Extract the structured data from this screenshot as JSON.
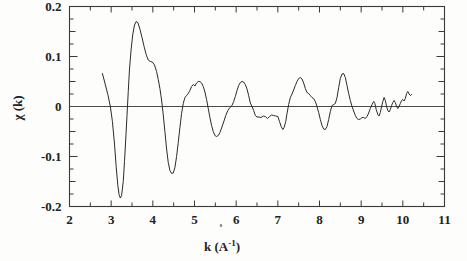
{
  "figure": {
    "title": "",
    "background_color": "#fdfdfc",
    "line_color": "#2b2b2b",
    "axis_color": "#3a3a3a"
  },
  "axes": {
    "x_title_prefix": "k (",
    "x_title_element": "A",
    "x_title_ring": "˚",
    "x_title_exponent": "-1",
    "x_title_suffix": ")",
    "x_title_full": "k (Å⁻¹)",
    "y_title": "χ (k)",
    "x_tick_labels": [
      "2",
      "3",
      "4",
      "5",
      "6",
      "7",
      "8",
      "9",
      "10",
      "11"
    ],
    "y_tick_labels": [
      "0.2",
      "0.1",
      "0",
      "-0.1",
      "-0.2"
    ],
    "x_minor_step": 0.5,
    "y_minor_step": 0.025,
    "grid": "off"
  },
  "chart_data": {
    "type": "line",
    "title": "",
    "xlabel": "k (Å⁻¹)",
    "ylabel": "χ (k)",
    "xlim": [
      2,
      11
    ],
    "ylim": [
      -0.2,
      0.2
    ],
    "xticks": [
      2,
      3,
      4,
      5,
      6,
      7,
      8,
      9,
      10,
      11
    ],
    "yticks": [
      -0.2,
      -0.1,
      0,
      0.1,
      0.2
    ],
    "grid": false,
    "legend": "none",
    "series": [
      {
        "name": "chi(k)",
        "color": "#2b2b2b",
        "points": [
          [
            2.79,
            0.066
          ],
          [
            2.85,
            0.047
          ],
          [
            2.92,
            0.024
          ],
          [
            2.98,
            0.0
          ],
          [
            3.03,
            -0.03
          ],
          [
            3.08,
            -0.075
          ],
          [
            3.12,
            -0.12
          ],
          [
            3.16,
            -0.158
          ],
          [
            3.19,
            -0.176
          ],
          [
            3.22,
            -0.183
          ],
          [
            3.25,
            -0.178
          ],
          [
            3.29,
            -0.15
          ],
          [
            3.32,
            -0.11
          ],
          [
            3.35,
            -0.065
          ],
          [
            3.38,
            -0.018
          ],
          [
            3.41,
            0.03
          ],
          [
            3.44,
            0.075
          ],
          [
            3.48,
            0.115
          ],
          [
            3.52,
            0.145
          ],
          [
            3.56,
            0.163
          ],
          [
            3.6,
            0.17
          ],
          [
            3.64,
            0.168
          ],
          [
            3.69,
            0.155
          ],
          [
            3.74,
            0.138
          ],
          [
            3.79,
            0.12
          ],
          [
            3.84,
            0.104
          ],
          [
            3.89,
            0.093
          ],
          [
            3.94,
            0.09
          ],
          [
            3.99,
            0.089
          ],
          [
            4.04,
            0.083
          ],
          [
            4.09,
            0.07
          ],
          [
            4.13,
            0.054
          ],
          [
            4.17,
            0.036
          ],
          [
            4.21,
            0.013
          ],
          [
            4.25,
            -0.017
          ],
          [
            4.29,
            -0.05
          ],
          [
            4.33,
            -0.085
          ],
          [
            4.37,
            -0.112
          ],
          [
            4.41,
            -0.128
          ],
          [
            4.45,
            -0.134
          ],
          [
            4.49,
            -0.133
          ],
          [
            4.53,
            -0.122
          ],
          [
            4.57,
            -0.1
          ],
          [
            4.61,
            -0.072
          ],
          [
            4.65,
            -0.042
          ],
          [
            4.69,
            -0.014
          ],
          [
            4.73,
            0.006
          ],
          [
            4.77,
            0.018
          ],
          [
            4.81,
            0.022
          ],
          [
            4.85,
            0.026
          ],
          [
            4.89,
            0.032
          ],
          [
            4.93,
            0.04
          ],
          [
            4.97,
            0.044
          ],
          [
            5.01,
            0.041
          ],
          [
            5.05,
            0.047
          ],
          [
            5.09,
            0.05
          ],
          [
            5.13,
            0.05
          ],
          [
            5.17,
            0.047
          ],
          [
            5.21,
            0.04
          ],
          [
            5.25,
            0.029
          ],
          [
            5.29,
            0.014
          ],
          [
            5.33,
            -0.004
          ],
          [
            5.37,
            -0.022
          ],
          [
            5.41,
            -0.038
          ],
          [
            5.45,
            -0.05
          ],
          [
            5.49,
            -0.058
          ],
          [
            5.53,
            -0.06
          ],
          [
            5.57,
            -0.058
          ],
          [
            5.61,
            -0.052
          ],
          [
            5.65,
            -0.043
          ],
          [
            5.7,
            -0.031
          ],
          [
            5.75,
            -0.018
          ],
          [
            5.8,
            -0.008
          ],
          [
            5.85,
            -0.002
          ],
          [
            5.9,
            0.002
          ],
          [
            5.94,
            0.01
          ],
          [
            5.98,
            0.02
          ],
          [
            6.02,
            0.032
          ],
          [
            6.06,
            0.042
          ],
          [
            6.1,
            0.048
          ],
          [
            6.14,
            0.05
          ],
          [
            6.18,
            0.049
          ],
          [
            6.22,
            0.044
          ],
          [
            6.26,
            0.035
          ],
          [
            6.3,
            0.022
          ],
          [
            6.34,
            0.007
          ],
          [
            6.38,
            0.0
          ],
          [
            6.42,
            -0.008
          ],
          [
            6.46,
            -0.018
          ],
          [
            6.5,
            -0.021
          ],
          [
            6.55,
            -0.021
          ],
          [
            6.6,
            -0.022
          ],
          [
            6.65,
            -0.019
          ],
          [
            6.7,
            -0.02
          ],
          [
            6.75,
            -0.024
          ],
          [
            6.8,
            -0.02
          ],
          [
            6.85,
            -0.017
          ],
          [
            6.9,
            -0.018
          ],
          [
            6.95,
            -0.019
          ],
          [
            7.0,
            -0.02
          ],
          [
            7.04,
            -0.03
          ],
          [
            7.08,
            -0.04
          ],
          [
            7.12,
            -0.046
          ],
          [
            7.15,
            -0.042
          ],
          [
            7.19,
            -0.03
          ],
          [
            7.22,
            -0.014
          ],
          [
            7.26,
            0.004
          ],
          [
            7.3,
            0.018
          ],
          [
            7.34,
            0.025
          ],
          [
            7.38,
            0.033
          ],
          [
            7.42,
            0.042
          ],
          [
            7.46,
            0.05
          ],
          [
            7.5,
            0.056
          ],
          [
            7.54,
            0.058
          ],
          [
            7.58,
            0.055
          ],
          [
            7.62,
            0.047
          ],
          [
            7.66,
            0.036
          ],
          [
            7.7,
            0.028
          ],
          [
            7.74,
            0.026
          ],
          [
            7.78,
            0.022
          ],
          [
            7.82,
            0.018
          ],
          [
            7.86,
            0.016
          ],
          [
            7.9,
            0.01
          ],
          [
            7.94,
            0.0
          ],
          [
            7.98,
            -0.012
          ],
          [
            8.02,
            -0.026
          ],
          [
            8.06,
            -0.038
          ],
          [
            8.1,
            -0.045
          ],
          [
            8.14,
            -0.046
          ],
          [
            8.18,
            -0.04
          ],
          [
            8.22,
            -0.026
          ],
          [
            8.26,
            -0.01
          ],
          [
            8.3,
            0.002
          ],
          [
            8.34,
            0.004
          ],
          [
            8.38,
            0.006
          ],
          [
            8.42,
            0.018
          ],
          [
            8.46,
            0.038
          ],
          [
            8.5,
            0.056
          ],
          [
            8.54,
            0.065
          ],
          [
            8.58,
            0.066
          ],
          [
            8.62,
            0.058
          ],
          [
            8.66,
            0.042
          ],
          [
            8.7,
            0.026
          ],
          [
            8.74,
            0.012
          ],
          [
            8.78,
            0.0
          ],
          [
            8.82,
            -0.009
          ],
          [
            8.86,
            -0.018
          ],
          [
            8.9,
            -0.024
          ],
          [
            8.94,
            -0.026
          ],
          [
            8.98,
            -0.025
          ],
          [
            9.02,
            -0.022
          ],
          [
            9.06,
            -0.022
          ],
          [
            9.1,
            -0.024
          ],
          [
            9.14,
            -0.02
          ],
          [
            9.18,
            -0.013
          ],
          [
            9.22,
            -0.004
          ],
          [
            9.26,
            0.004
          ],
          [
            9.3,
            0.01
          ],
          [
            9.33,
            0.006
          ],
          [
            9.36,
            -0.006
          ],
          [
            9.4,
            -0.016
          ],
          [
            9.43,
            -0.019
          ],
          [
            9.46,
            -0.012
          ],
          [
            9.49,
            0.0
          ],
          [
            9.52,
            0.01
          ],
          [
            9.55,
            0.018
          ],
          [
            9.58,
            0.012
          ],
          [
            9.61,
            0.0
          ],
          [
            9.64,
            -0.008
          ],
          [
            9.67,
            -0.011
          ],
          [
            9.7,
            -0.006
          ],
          [
            9.73,
            0.002
          ],
          [
            9.76,
            0.008
          ],
          [
            9.79,
            0.012
          ],
          [
            9.82,
            0.008
          ],
          [
            9.85,
            0.0
          ],
          [
            9.88,
            -0.004
          ],
          [
            9.91,
            0.0
          ],
          [
            9.94,
            0.006
          ],
          [
            9.97,
            0.012
          ],
          [
            10.0,
            0.014
          ],
          [
            10.03,
            0.011
          ],
          [
            10.06,
            0.016
          ],
          [
            10.09,
            0.026
          ],
          [
            10.12,
            0.03
          ],
          [
            10.15,
            0.025
          ],
          [
            10.18,
            0.022
          ],
          [
            10.21,
            0.024
          ]
        ]
      }
    ]
  }
}
